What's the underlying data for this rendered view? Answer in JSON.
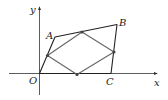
{
  "diagram": {
    "axes": {
      "x_label": "x",
      "y_label": "y",
      "origin_label": "O",
      "x_axis": {
        "x1": 9,
        "y1": 73.5,
        "x2": 157,
        "y2": 73.5
      },
      "y_axis": {
        "x1": 39.5,
        "y1": 95,
        "x2": 39.5,
        "y2": 7
      }
    },
    "points": {
      "O": {
        "label": "O",
        "x": 39.5,
        "y": 73.5
      },
      "A": {
        "label": "A",
        "x": 55,
        "y": 37
      },
      "B": {
        "label": "B",
        "x": 117,
        "y": 24.5
      },
      "C": {
        "label": "C",
        "x": 111,
        "y": 73.5
      }
    },
    "midpoints": [
      {
        "name": "mid-OA",
        "x": 47.5,
        "y": 55.5
      },
      {
        "name": "mid-AB",
        "x": 82,
        "y": 32
      },
      {
        "name": "mid-BC",
        "x": 114,
        "y": 52
      },
      {
        "name": "mid-OC",
        "x": 77,
        "y": 74.5
      }
    ],
    "labels": [
      {
        "name": "label-y",
        "text": "y",
        "x": 30,
        "y": 13
      },
      {
        "name": "label-A",
        "text": "A",
        "x": 46,
        "y": 39
      },
      {
        "name": "label-B",
        "text": "B",
        "x": 119,
        "y": 26
      },
      {
        "name": "label-O",
        "text": "O",
        "x": 29,
        "y": 84
      },
      {
        "name": "label-C",
        "text": "C",
        "x": 106,
        "y": 85
      },
      {
        "name": "label-x",
        "text": "x",
        "x": 154,
        "y": 86
      }
    ]
  }
}
